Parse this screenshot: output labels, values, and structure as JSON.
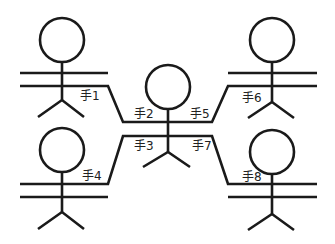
{
  "diagram": {
    "type": "stick-figure-handshake",
    "stroke_color": "#1a1a1a",
    "background": "#ffffff",
    "figures": [
      {
        "id": "top-left",
        "head": {
          "cx": 62,
          "cy": 40,
          "r": 22
        }
      },
      {
        "id": "top-right",
        "head": {
          "cx": 272,
          "cy": 40,
          "r": 22
        }
      },
      {
        "id": "center",
        "head": {
          "cx": 168,
          "cy": 87,
          "r": 22
        }
      },
      {
        "id": "bottom-left",
        "head": {
          "cx": 62,
          "cy": 150,
          "r": 22
        }
      },
      {
        "id": "bottom-right",
        "head": {
          "cx": 272,
          "cy": 152,
          "r": 22
        }
      }
    ],
    "labels": [
      {
        "id": "hand-1",
        "text": "手1",
        "x": 80,
        "y": 100
      },
      {
        "id": "hand-2",
        "text": "手2",
        "x": 134,
        "y": 118
      },
      {
        "id": "hand-3",
        "text": "手3",
        "x": 134,
        "y": 150
      },
      {
        "id": "hand-4",
        "text": "手4",
        "x": 82,
        "y": 180
      },
      {
        "id": "hand-5",
        "text": "手5",
        "x": 190,
        "y": 118
      },
      {
        "id": "hand-6",
        "text": "手6",
        "x": 242,
        "y": 102
      },
      {
        "id": "hand-7",
        "text": "手7",
        "x": 192,
        "y": 150
      },
      {
        "id": "hand-8",
        "text": "手8",
        "x": 242,
        "y": 181
      }
    ]
  }
}
